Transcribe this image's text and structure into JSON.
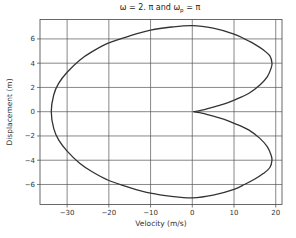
{
  "chart_data": {
    "type": "line",
    "title_parts": {
      "main": "ω = 2. π and ω",
      "sub": "p",
      "tail": " = π"
    },
    "xlabel": "Velocity (m/s)",
    "ylabel": "Displacement (m)",
    "xlim": [
      -36.5,
      21.5
    ],
    "ylim": [
      -7.65,
      7.6
    ],
    "xticks": [
      -30,
      -20,
      -10,
      0,
      10,
      20
    ],
    "xtick_labels": [
      "−30",
      "−20",
      "−10",
      "0",
      "10",
      "20"
    ],
    "yticks": [
      -6,
      -4,
      -2,
      0,
      2,
      4,
      6
    ],
    "ytick_labels": [
      "−6",
      "−4",
      "−2",
      "0",
      "2",
      "4",
      "6"
    ],
    "grid": true,
    "legend": null,
    "line_color": "#333333",
    "series": [
      {
        "name": "phase trajectory",
        "points": [
          [
            0.2,
            0.0
          ],
          [
            1.8,
            0.08
          ],
          [
            4.6,
            0.33
          ],
          [
            7.5,
            0.62
          ],
          [
            10.2,
            0.98
          ],
          [
            13.5,
            1.5
          ],
          [
            16.2,
            2.2
          ],
          [
            18.0,
            2.9
          ],
          [
            18.9,
            3.6
          ],
          [
            19.1,
            4.0
          ],
          [
            18.6,
            4.6
          ],
          [
            17.0,
            5.1
          ],
          [
            15.0,
            5.55
          ],
          [
            12.5,
            6.0
          ],
          [
            10.0,
            6.4
          ],
          [
            5.0,
            6.88
          ],
          [
            0.0,
            7.1
          ],
          [
            -5.0,
            6.98
          ],
          [
            -10.0,
            6.72
          ],
          [
            -15.0,
            6.25
          ],
          [
            -20.0,
            5.67
          ],
          [
            -24.0,
            4.95
          ],
          [
            -27.0,
            4.25
          ],
          [
            -30.0,
            3.25
          ],
          [
            -32.0,
            2.35
          ],
          [
            -33.2,
            1.4
          ],
          [
            -33.8,
            0.0
          ],
          [
            -33.2,
            -1.4
          ],
          [
            -32.0,
            -2.35
          ],
          [
            -30.0,
            -3.25
          ],
          [
            -27.0,
            -4.25
          ],
          [
            -24.0,
            -4.95
          ],
          [
            -20.0,
            -5.67
          ],
          [
            -15.0,
            -6.25
          ],
          [
            -10.0,
            -6.72
          ],
          [
            -5.0,
            -6.98
          ],
          [
            0.0,
            -7.1
          ],
          [
            5.0,
            -6.88
          ],
          [
            10.0,
            -6.4
          ],
          [
            12.5,
            -6.0
          ],
          [
            15.0,
            -5.55
          ],
          [
            17.0,
            -5.1
          ],
          [
            18.6,
            -4.6
          ],
          [
            19.1,
            -4.0
          ],
          [
            18.9,
            -3.6
          ],
          [
            18.0,
            -2.9
          ],
          [
            16.2,
            -2.2
          ],
          [
            13.5,
            -1.5
          ],
          [
            10.2,
            -0.98
          ],
          [
            7.5,
            -0.62
          ],
          [
            4.6,
            -0.33
          ],
          [
            1.8,
            -0.08
          ],
          [
            0.2,
            0.0
          ]
        ]
      }
    ]
  }
}
